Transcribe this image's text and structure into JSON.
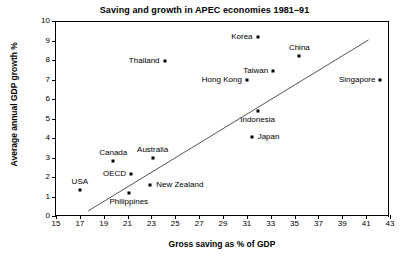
{
  "chart_data": {
    "type": "scatter",
    "title": "Saving and growth in APEC economies 1981–91",
    "xlabel": "Gross saving as % of GDP",
    "ylabel": "Average annual GDP growth %",
    "xlim": [
      15,
      43
    ],
    "ylim": [
      0,
      10
    ],
    "xticks": [
      15,
      17,
      19,
      21,
      23,
      25,
      27,
      29,
      31,
      33,
      35,
      37,
      39,
      41,
      43
    ],
    "yticks": [
      0,
      1,
      2,
      3,
      4,
      5,
      6,
      7,
      8,
      9,
      10
    ],
    "grid": false,
    "legend": "none",
    "points": [
      {
        "label": "USA",
        "x": 17.0,
        "y": 1.33,
        "label_pos": "above"
      },
      {
        "label": "Canada",
        "x": 19.8,
        "y": 2.84,
        "label_pos": "above"
      },
      {
        "label": "OECD",
        "x": 21.3,
        "y": 2.15,
        "label_pos": "left"
      },
      {
        "label": "Philippines",
        "x": 21.1,
        "y": 1.18,
        "label_pos": "below"
      },
      {
        "label": "Australia",
        "x": 23.1,
        "y": 2.98,
        "label_pos": "above"
      },
      {
        "label": "New Zealand",
        "x": 22.9,
        "y": 1.58,
        "label_pos": "right"
      },
      {
        "label": "Thailand",
        "x": 24.1,
        "y": 7.95,
        "label_pos": "left"
      },
      {
        "label": "Hong Kong",
        "x": 31.0,
        "y": 7.0,
        "label_pos": "left"
      },
      {
        "label": "Japan",
        "x": 31.4,
        "y": 4.05,
        "label_pos": "right"
      },
      {
        "label": "Indonesia",
        "x": 31.9,
        "y": 5.4,
        "label_pos": "below"
      },
      {
        "label": "Korea",
        "x": 31.9,
        "y": 9.18,
        "label_pos": "left"
      },
      {
        "label": "Taiwan",
        "x": 33.2,
        "y": 7.46,
        "label_pos": "left"
      },
      {
        "label": "China",
        "x": 35.4,
        "y": 8.22,
        "label_pos": "above"
      },
      {
        "label": "Singapore",
        "x": 42.2,
        "y": 7.0,
        "label_pos": "left"
      }
    ],
    "trendline": {
      "x0": 17.7,
      "y0": 0.26,
      "x1": 41.2,
      "y1": 9.03
    },
    "colors": {
      "marker": "#000000",
      "line": "#555555",
      "axis": "#000000",
      "background": "#ffffff"
    }
  }
}
